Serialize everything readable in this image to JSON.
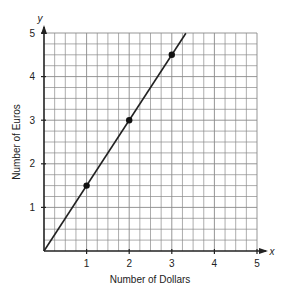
{
  "chart_data": {
    "type": "line",
    "title": "",
    "xlabel": "Number of Dollars",
    "ylabel": "Number of Euros",
    "x_axis_variable": "x",
    "y_axis_variable": "y",
    "xlim": [
      0,
      5
    ],
    "ylim": [
      0,
      5
    ],
    "x_ticks": [
      1,
      2,
      3,
      4,
      5
    ],
    "y_ticks": [
      1,
      2,
      3,
      4,
      5
    ],
    "grid": true,
    "minor_grid_per_unit": 4,
    "legend": null,
    "series": [
      {
        "name": "Euros vs Dollars",
        "line": {
          "slope": 1.5,
          "intercept": 0,
          "x_start": 0,
          "x_end": 3.33
        },
        "points": [
          {
            "x": 1,
            "y": 1.5
          },
          {
            "x": 2,
            "y": 3
          },
          {
            "x": 3,
            "y": 4.5
          }
        ]
      }
    ]
  },
  "colors": {
    "grid": "#8a8a8a",
    "axis": "#222222",
    "line": "#222222",
    "point": "#111111",
    "background": "#ffffff"
  }
}
